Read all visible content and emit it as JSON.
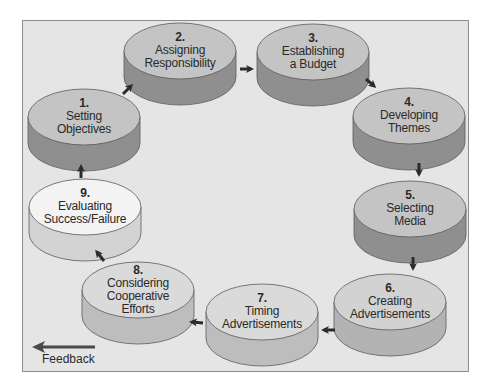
{
  "diagram": {
    "type": "cycle",
    "title": "",
    "colors": {
      "background": "#e5e5e5",
      "frame_border": "#8c8c8c",
      "cylinder_top": "#c4c4c4",
      "cylinder_side": "#8f8f8f",
      "cylinder_top_light": "#f2f2f2",
      "cylinder_side_light": "#cfcfcf",
      "arrow": "#2b2b2b",
      "text": "#2a2a2a"
    },
    "steps": [
      {
        "num": "1.",
        "line1": "Setting",
        "line2": "Objectives",
        "line3": ""
      },
      {
        "num": "2.",
        "line1": "Assigning",
        "line2": "Responsibility",
        "line3": ""
      },
      {
        "num": "3.",
        "line1": "Establishing",
        "line2": "a Budget",
        "line3": ""
      },
      {
        "num": "4.",
        "line1": "Developing",
        "line2": "Themes",
        "line3": ""
      },
      {
        "num": "5.",
        "line1": "Selecting",
        "line2": "Media",
        "line3": ""
      },
      {
        "num": "6.",
        "line1": "Creating",
        "line2": "Advertisements",
        "line3": ""
      },
      {
        "num": "7.",
        "line1": "Timing",
        "line2": "Advertisements",
        "line3": ""
      },
      {
        "num": "8.",
        "line1": "Considering",
        "line2": "Cooperative",
        "line3": "Efforts"
      },
      {
        "num": "9.",
        "line1": "Evaluating",
        "line2": "Success/Failure",
        "line3": ""
      }
    ],
    "flow": [
      "1→2",
      "2→3",
      "3→4",
      "4→5",
      "5→6",
      "6→7",
      "7→8",
      "8→9",
      "9→1"
    ],
    "legend": {
      "feedback_label": "Feedback"
    }
  }
}
